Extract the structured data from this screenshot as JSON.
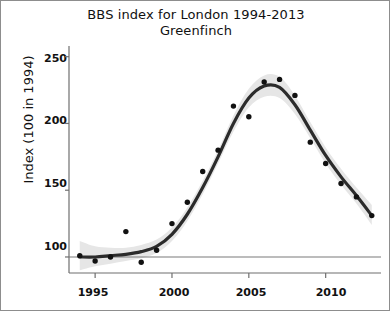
{
  "chart_data": {
    "type": "scatter",
    "title": "BBS index for London 1994-2013",
    "subtitle": "Greenfinch",
    "xlabel": "",
    "ylabel": "Index (100 in 1994)",
    "xlim": [
      1993.3,
      2013.6
    ],
    "ylim": [
      88,
      258
    ],
    "grid": false,
    "legend": null,
    "xticks": [
      1995,
      2000,
      2005,
      2010
    ],
    "yticks": [
      100,
      150,
      200,
      250
    ],
    "reference_line": {
      "y": 100,
      "color": "#7a7a7a"
    },
    "series": [
      {
        "name": "Annual index",
        "kind": "points",
        "color": "#111111",
        "x": [
          1994,
          1995,
          1996,
          1997,
          1998,
          1999,
          2000,
          2001,
          2002,
          2003,
          2004,
          2005,
          2006,
          2007,
          2008,
          2009,
          2010,
          2011,
          2012,
          2013
        ],
        "y": [
          101,
          97,
          100,
          119,
          96,
          105,
          125,
          141,
          164,
          180,
          213,
          205,
          231,
          233,
          221,
          186,
          170,
          155,
          145,
          131
        ]
      },
      {
        "name": "Smoothed trend",
        "kind": "line",
        "color": "#2b2b2b",
        "x": [
          1994,
          1995,
          1996,
          1997,
          1998,
          1999,
          2000,
          2001,
          2002,
          2003,
          2004,
          2005,
          2006,
          2007,
          2008,
          2009,
          2010,
          2011,
          2012,
          2013
        ],
        "y": [
          100,
          100,
          101,
          102,
          104,
          108,
          117,
          132,
          152,
          175,
          200,
          219,
          228,
          227,
          214,
          195,
          176,
          160,
          146,
          131
        ]
      },
      {
        "name": "Confidence band",
        "kind": "band",
        "color": "#e6e6e6",
        "x": [
          1994,
          1995,
          1996,
          1997,
          1998,
          1999,
          2000,
          2001,
          2002,
          2003,
          2004,
          2005,
          2006,
          2007,
          2008,
          2009,
          2010,
          2011,
          2012,
          2013
        ],
        "lower": [
          90,
          93,
          95,
          97,
          99,
          103,
          112,
          127,
          147,
          170,
          194,
          212,
          220,
          219,
          207,
          189,
          170,
          154,
          140,
          124
        ],
        "upper": [
          112,
          108,
          107,
          107,
          109,
          113,
          122,
          137,
          157,
          180,
          206,
          226,
          236,
          235,
          221,
          201,
          182,
          166,
          152,
          139
        ]
      }
    ]
  },
  "axes": {
    "y_tick_labels": [
      "250",
      "200",
      "150",
      "100"
    ],
    "x_tick_labels": [
      "1995",
      "2000",
      "2005",
      "2010"
    ],
    "y_axis_title": "Index (100 in 1994)"
  },
  "title": {
    "line1": "BBS index for London 1994-2013",
    "line2": "Greenfinch"
  }
}
